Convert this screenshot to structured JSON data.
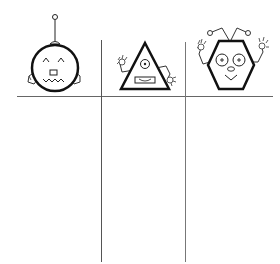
{
  "worksheet": {
    "type": "sorting-chart",
    "columns": [
      {
        "header_icon": "round-robot-icon",
        "shape": "circle",
        "label": ""
      },
      {
        "header_icon": "triangle-robot-icon",
        "shape": "triangle",
        "label": ""
      },
      {
        "header_icon": "hexagon-robot-icon",
        "shape": "hexagon",
        "label": ""
      }
    ],
    "line_color": "#555555",
    "ink_color": "#111111"
  }
}
